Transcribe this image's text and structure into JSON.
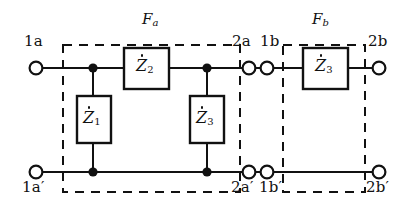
{
  "diagram": {
    "line_color": "#111111",
    "dash_color": "#111111",
    "background": "#ffffff",
    "blocks": [
      {
        "id": "Fa",
        "label": "F",
        "subscript": "a",
        "x": 63,
        "y": 45,
        "w": 177,
        "h": 147,
        "label_x": 142,
        "label_y": 18
      },
      {
        "id": "Fb",
        "label": "F",
        "subscript": "b",
        "x": 283,
        "y": 45,
        "w": 82,
        "h": 147,
        "label_x": 312,
        "label_y": 18
      }
    ],
    "impedances": [
      {
        "id": "Z2",
        "label": "Z",
        "subscript": "2",
        "orientation": "horizontal",
        "x": 124,
        "y": 48,
        "w": 45,
        "h": 41,
        "label_x": 136,
        "label_y": 60
      },
      {
        "id": "Z1",
        "label": "Z",
        "subscript": "1",
        "orientation": "vertical",
        "x": 77,
        "y": 96,
        "w": 34,
        "h": 47,
        "label_x": 83,
        "label_y": 111
      },
      {
        "id": "Z3a",
        "label": "Z",
        "subscript": "3",
        "orientation": "vertical",
        "x": 190,
        "y": 96,
        "w": 34,
        "h": 47,
        "label_x": 196,
        "label_y": 111
      },
      {
        "id": "Z3b",
        "label": "Z",
        "subscript": "3",
        "orientation": "horizontal",
        "x": 303,
        "y": 48,
        "w": 45,
        "h": 41,
        "label_x": 315,
        "label_y": 60
      }
    ],
    "terminals": [
      {
        "id": "1a",
        "label": "1a",
        "prime": false,
        "cx": 36,
        "cy": 68,
        "label_x": 24,
        "label_y": 41
      },
      {
        "id": "2a",
        "label": "2a",
        "prime": false,
        "cx": 249,
        "cy": 68,
        "label_x": 232,
        "label_y": 41
      },
      {
        "id": "1b",
        "label": "1b",
        "prime": false,
        "cx": 267,
        "cy": 68,
        "label_x": 262,
        "label_y": 41
      },
      {
        "id": "2b",
        "label": "2b",
        "prime": false,
        "cx": 379,
        "cy": 68,
        "label_x": 368,
        "label_y": 41
      },
      {
        "id": "1ap",
        "label": "1a",
        "prime": true,
        "cx": 36,
        "cy": 172,
        "label_x": 22,
        "label_y": 180
      },
      {
        "id": "2ap",
        "label": "2a",
        "prime": true,
        "cx": 249,
        "cy": 172,
        "label_x": 231,
        "label_y": 180
      },
      {
        "id": "1bp",
        "label": "1b",
        "prime": true,
        "cx": 267,
        "cy": 172,
        "label_x": 262,
        "label_y": 180
      },
      {
        "id": "2bp",
        "label": "2b",
        "prime": true,
        "cx": 379,
        "cy": 172,
        "label_x": 366,
        "label_y": 180
      }
    ],
    "junctions": [
      {
        "id": "top-left",
        "cx": 93,
        "cy": 68
      },
      {
        "id": "top-right",
        "cx": 207,
        "cy": 68
      },
      {
        "id": "bottom-left",
        "cx": 93,
        "cy": 172
      },
      {
        "id": "bottom-right",
        "cx": 207,
        "cy": 172
      }
    ],
    "rails": {
      "top_y": 68,
      "bottom_y": 172
    },
    "dot_accent": "superscript-dot"
  }
}
